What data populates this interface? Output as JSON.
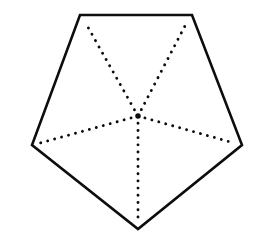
{
  "figure": {
    "shape_name": "pentagon",
    "background_color": "#ffffff",
    "canvas": {
      "width": 253,
      "height": 244
    },
    "outline": {
      "name": "pentagon-outline",
      "stroke_color": "#0d0d0d",
      "stroke_width": 2.6,
      "fill_color": "#ffffff",
      "points": "80,15 192,15 242,145 138,229 32,145"
    },
    "center_point": {
      "name": "center",
      "x": 138,
      "y": 116,
      "label": ""
    },
    "vertices": [
      {
        "name": "vertex-top-left",
        "x": 80,
        "y": 15,
        "label": ""
      },
      {
        "name": "vertex-top-right",
        "x": 192,
        "y": 15,
        "label": ""
      },
      {
        "name": "vertex-right",
        "x": 242,
        "y": 145,
        "label": ""
      },
      {
        "name": "vertex-bottom",
        "x": 138,
        "y": 229,
        "label": ""
      },
      {
        "name": "vertex-left",
        "x": 32,
        "y": 145,
        "label": ""
      }
    ],
    "radii": {
      "style": "dotted",
      "dot_color": "#0d0d0d",
      "dot_size": 2.9,
      "dot_gap": 7.2,
      "segments": [
        {
          "name": "radius-to-top-left",
          "x1": 138,
          "y1": 116,
          "x2": 85,
          "y2": 22
        },
        {
          "name": "radius-to-top-right",
          "x1": 138,
          "y1": 116,
          "x2": 187,
          "y2": 22
        },
        {
          "name": "radius-to-right",
          "x1": 138,
          "y1": 116,
          "x2": 234,
          "y2": 143
        },
        {
          "name": "radius-to-bottom",
          "x1": 138,
          "y1": 116,
          "x2": 138,
          "y2": 222
        },
        {
          "name": "radius-to-left",
          "x1": 138,
          "y1": 116,
          "x2": 40,
          "y2": 143
        }
      ]
    },
    "artifacts": [
      {
        "name": "scan-smudge",
        "x": 111,
        "y": 145,
        "width": 4,
        "height": 7,
        "color": "#e9e4ea"
      }
    ]
  }
}
